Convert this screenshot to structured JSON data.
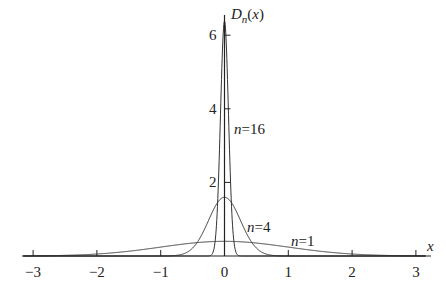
{
  "chart_data": {
    "type": "line",
    "title": "",
    "xlabel": "x",
    "ylabel": "D_n(x)",
    "ylabel_parts": {
      "base": "D",
      "sub": "n",
      "arg": "(x)"
    },
    "xlim": [
      -3,
      3
    ],
    "ylim": [
      0,
      6.5
    ],
    "grid": false,
    "legend": "inline labels",
    "x_ticks": [
      -3,
      -2,
      -1,
      0,
      1,
      2,
      3
    ],
    "x_tick_labels": [
      "−3",
      "−2",
      "−1",
      "0",
      "1",
      "2",
      "3"
    ],
    "y_ticks": [
      2,
      4,
      6
    ],
    "y_tick_labels": [
      "2",
      "4",
      "6"
    ],
    "function": "D_n(x) = n / sqrt(2*pi) * exp(-(n*x)^2 / 2)",
    "series": [
      {
        "name": "n=1",
        "n": 1,
        "peak": 0.4,
        "label": {
          "var": "n",
          "eq": "=1"
        }
      },
      {
        "name": "n=4",
        "n": 4,
        "peak": 1.6,
        "label": {
          "var": "n",
          "eq": "=4"
        }
      },
      {
        "name": "n=16",
        "n": 16,
        "peak": 6.38,
        "label": {
          "var": "n",
          "eq": "=16"
        }
      }
    ],
    "sample_points": {
      "x": [
        -3,
        -2,
        -1,
        -0.5,
        -0.25,
        0,
        0.25,
        0.5,
        1,
        2,
        3
      ],
      "n=1": [
        0.004,
        0.054,
        0.242,
        0.352,
        0.387,
        0.399,
        0.387,
        0.352,
        0.242,
        0.054,
        0.004
      ],
      "n=4": [
        0.0,
        0.0,
        0.001,
        0.216,
        0.968,
        1.596,
        0.968,
        0.216,
        0.001,
        0.0,
        0.0
      ],
      "n=16": [
        0.0,
        0.0,
        0.0,
        0.0,
        0.003,
        6.383,
        0.003,
        0.0,
        0.0,
        0.0,
        0.0
      ]
    }
  }
}
